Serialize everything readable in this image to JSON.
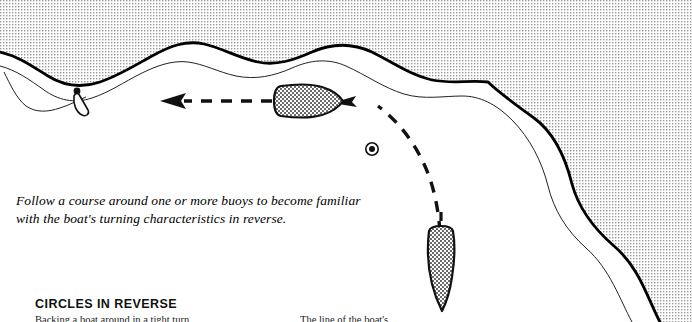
{
  "figure": {
    "caption_line1": "Follow a course around one or more buoys to become familiar",
    "caption_line2": "with the boat's turning characteristics in reverse.",
    "heading": "CIRCLES IN REVERSE",
    "body_left": "Backing a boat around in a tight turn",
    "body_right": "The line of the boat's"
  },
  "elements": {
    "shoreline_name": "shoreline",
    "land_name": "land-area",
    "water_name": "water-area",
    "dock_name": "dock-pier",
    "buoy_name": "buoy-marker",
    "boat_horizontal_name": "boat-reversing-horizontal",
    "boat_vertical_name": "boat-reversing-vertical",
    "track_curve_name": "reverse-track-curve",
    "arrow_left_name": "direction-arrow-left",
    "arrow_mid_name": "direction-arrow-mid"
  },
  "colors": {
    "ink": "#111111",
    "shore_line": "#000000",
    "land_tint": "#e8e8e8",
    "boat_fill": "#d9d9d9",
    "paper": "#ffffff"
  }
}
